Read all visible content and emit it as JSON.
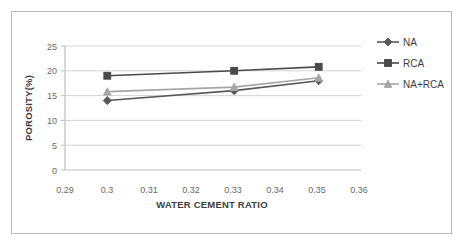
{
  "chart_data": {
    "type": "line",
    "title": "",
    "xlabel": "WATER CEMENT RATIO",
    "ylabel": "POROSITY(%)",
    "x": [
      0.3,
      0.33,
      0.35
    ],
    "xlim": [
      0.29,
      0.36
    ],
    "ylim": [
      0,
      25
    ],
    "xticks": [
      "0.29",
      "0.3",
      "0.31",
      "0.32",
      "0.33",
      "0.34",
      "0.35",
      "0.36"
    ],
    "xtick_values": [
      0.29,
      0.3,
      0.31,
      0.32,
      0.33,
      0.34,
      0.35,
      0.36
    ],
    "yticks": [
      "0",
      "5",
      "10",
      "15",
      "20",
      "25"
    ],
    "ytick_values": [
      0,
      5,
      10,
      15,
      20,
      25
    ],
    "grid": "horizontal",
    "legend_position": "right",
    "series": [
      {
        "name": "NA",
        "values": [
          14.0,
          16.0,
          18.0
        ],
        "color": "#595959",
        "marker": "diamond"
      },
      {
        "name": "RCA",
        "values": [
          19.0,
          20.0,
          20.8
        ],
        "color": "#4a4a4a",
        "marker": "square"
      },
      {
        "name": "NA+RCA",
        "values": [
          15.8,
          16.7,
          18.6
        ],
        "color": "#a6a6a6",
        "marker": "triangle"
      }
    ]
  },
  "axes": {
    "x_title": "WATER CEMENT RATIO",
    "y_title": "POROSITY(%)",
    "x_tick_labels": [
      "0.29",
      "0.3",
      "0.31",
      "0.32",
      "0.33",
      "0.34",
      "0.35",
      "0.36"
    ],
    "y_tick_labels": [
      "0",
      "5",
      "10",
      "15",
      "20",
      "25"
    ]
  },
  "legend": {
    "items": [
      {
        "label": "NA",
        "color": "#595959",
        "marker": "diamond-marker-icon"
      },
      {
        "label": "RCA",
        "color": "#4a4a4a",
        "marker": "square-marker-icon"
      },
      {
        "label": "NA+RCA",
        "color": "#a6a6a6",
        "marker": "triangle-marker-icon"
      }
    ]
  },
  "colors": {
    "frame_border": "#b9b9b9",
    "gridline": "#d4d4d4",
    "axis_line": "#bfbfbf",
    "tick_label": "#6a6a6a",
    "axis_title": "#3d3d3d",
    "background": "#ffffff"
  }
}
